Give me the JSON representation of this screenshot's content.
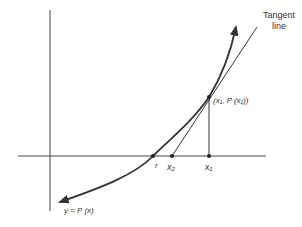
{
  "diagram": {
    "labels": {
      "tangent_line_1": "Tangent",
      "tangent_line_2": "line",
      "point_label": "(x₁, P (x₁))",
      "r": "r",
      "x2": "x₂",
      "x1": "x₁",
      "curve": "y = P (x)"
    },
    "colors": {
      "stroke": "#333333",
      "axis": "#444444",
      "background": "#ffffff"
    },
    "geometry": {
      "y_axis_x": 50,
      "x_axis_y": 156,
      "r_x": 153,
      "x2_x": 172,
      "x1_x": 209,
      "tangent_point": [
        209,
        97
      ]
    }
  }
}
